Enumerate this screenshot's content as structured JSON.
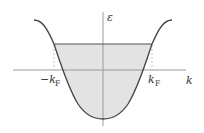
{
  "diagram": {
    "type": "band-dispersion",
    "axes": {
      "y_label": "ε",
      "x_label": "k"
    },
    "markers": {
      "left_label_main": "−k",
      "left_label_sub": "F",
      "right_label_main": "k",
      "right_label_sub": "F"
    },
    "colors": {
      "curve": "#444444",
      "axis": "#999999",
      "fill": "#e3e3e3",
      "fermi_line": "#555555",
      "dashed": "#aaaaaa"
    }
  }
}
